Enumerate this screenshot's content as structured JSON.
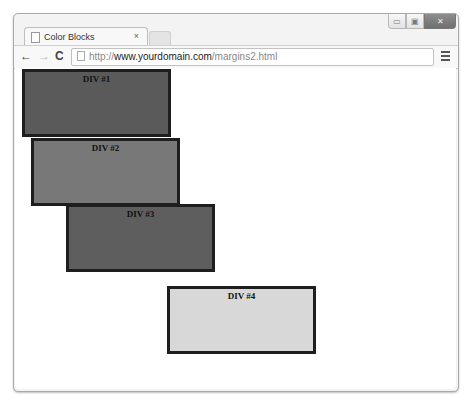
{
  "window": {
    "controls": {
      "minimize_icon": "minimize-icon",
      "maximize_icon": "maximize-icon",
      "close_icon": "close-icon"
    }
  },
  "tabs": [
    {
      "title": "Color Blocks",
      "close": "×",
      "active": true
    }
  ],
  "toolbar": {
    "back": "←",
    "forward": "→",
    "reload": "C",
    "url_scheme": "http://",
    "url_domain": "www.yourdomain.com",
    "url_path": "/margins2.html"
  },
  "page": {
    "blocks": [
      {
        "label": "DIV #1",
        "color": "#5a5a5a"
      },
      {
        "label": "DIV #2",
        "color": "#787878"
      },
      {
        "label": "DIV #3",
        "color": "#5e5e5e"
      },
      {
        "label": "DIV #4",
        "color": "#d8d8d8"
      }
    ]
  }
}
